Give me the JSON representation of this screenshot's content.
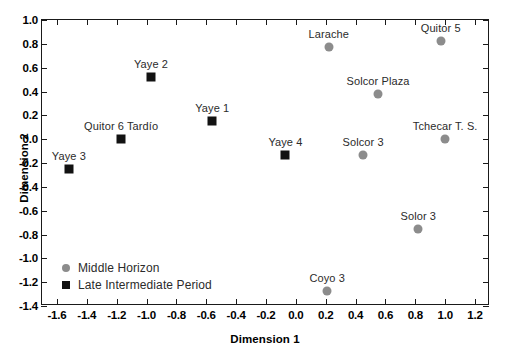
{
  "chart_data": {
    "type": "scatter",
    "title": "",
    "subtitle": "",
    "xlabel": "Dimension 1",
    "ylabel": "Dimension 2",
    "xlim": [
      -1.7,
      1.3
    ],
    "ylim": [
      -1.4,
      1.0
    ],
    "xticks": [
      -1.6,
      -1.4,
      -1.2,
      -1.0,
      -0.8,
      -0.6,
      -0.4,
      -0.2,
      0.0,
      0.2,
      0.4,
      0.6,
      0.8,
      1.0,
      1.2
    ],
    "yticks": [
      -1.4,
      -1.2,
      -1.0,
      -0.8,
      -0.6,
      -0.4,
      -0.2,
      0.0,
      0.2,
      0.4,
      0.6,
      0.8,
      1.0
    ],
    "xtick_labels": [
      "-1.6",
      "-1.4",
      "-1.2",
      "-1.0",
      "-0.8",
      "-0.6",
      "-0.4",
      "-0.2",
      "0.0",
      "0.2",
      "0.4",
      "0.6",
      "0.8",
      "1.0",
      "1.2"
    ],
    "ytick_labels": [
      "-1.4",
      "-1.2",
      "-1.0",
      "-0.8",
      "-0.6",
      "-0.4",
      "-0.2",
      "0.0",
      "0.2",
      "0.4",
      "0.6",
      "0.8",
      "1.0"
    ],
    "grid": false,
    "legend_position": "lower-left-inside",
    "series": [
      {
        "name": "Middle Horizon",
        "marker": "circle",
        "color": "#8c8c8c",
        "points": [
          {
            "label": "Larache",
            "x": 0.22,
            "y": 0.77,
            "label_position": "above"
          },
          {
            "label": "Quitor 5",
            "x": 0.97,
            "y": 0.82,
            "label_position": "above"
          },
          {
            "label": "Solcor Plaza",
            "x": 0.55,
            "y": 0.38,
            "label_position": "above"
          },
          {
            "label": "Tchecar T. S.",
            "x": 1.0,
            "y": 0.0,
            "label_position": "above"
          },
          {
            "label": "Solcor 3",
            "x": 0.45,
            "y": -0.13,
            "label_position": "above"
          },
          {
            "label": "Solor 3",
            "x": 0.82,
            "y": -0.75,
            "label_position": "above"
          },
          {
            "label": "Coyo 3",
            "x": 0.21,
            "y": -1.27,
            "label_position": "above"
          }
        ]
      },
      {
        "name": "Late Intermediate Period",
        "marker": "square",
        "color": "#121212",
        "points": [
          {
            "label": "Yaye 3",
            "x": -1.52,
            "y": -0.25,
            "label_position": "above"
          },
          {
            "label": "Quitor 6 Tardío",
            "x": -1.17,
            "y": 0.0,
            "label_position": "above"
          },
          {
            "label": "Yaye 2",
            "x": -0.97,
            "y": 0.52,
            "label_position": "above"
          },
          {
            "label": "Yaye 1",
            "x": -0.56,
            "y": 0.15,
            "label_position": "above"
          },
          {
            "label": "Yaye 4",
            "x": -0.07,
            "y": -0.13,
            "label_position": "above"
          }
        ]
      }
    ]
  },
  "legend": {
    "items": [
      {
        "label": "Middle Horizon",
        "marker": "circle-icon",
        "color": "#8c8c8c"
      },
      {
        "label": "Late Intermediate Period",
        "marker": "square-icon",
        "color": "#121212"
      }
    ]
  },
  "axes": {
    "x_title": "Dimension 1",
    "y_title": "Dimension 2"
  }
}
